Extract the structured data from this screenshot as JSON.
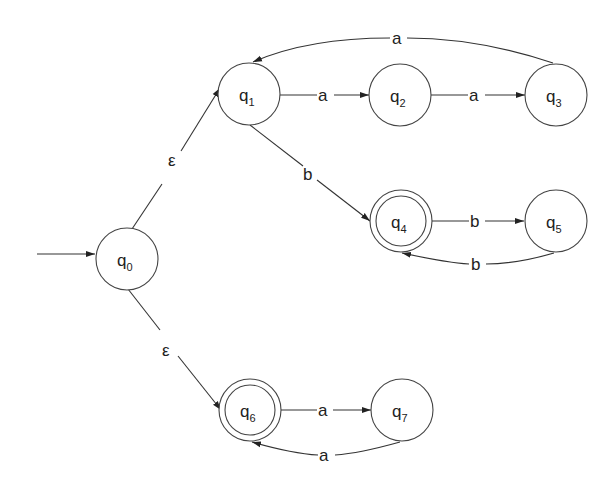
{
  "diagram": {
    "type": "NFA state diagram",
    "start_state": "q0",
    "nodes": [
      {
        "id": "q0",
        "base": "q",
        "sub": "0",
        "accepting": false,
        "cx": 127,
        "cy": 259
      },
      {
        "id": "q1",
        "base": "q",
        "sub": "1",
        "accepting": false,
        "cx": 249,
        "cy": 94
      },
      {
        "id": "q2",
        "base": "q",
        "sub": "2",
        "accepting": false,
        "cx": 400,
        "cy": 95
      },
      {
        "id": "q3",
        "base": "q",
        "sub": "3",
        "accepting": false,
        "cx": 556,
        "cy": 95
      },
      {
        "id": "q4",
        "base": "q",
        "sub": "4",
        "accepting": true,
        "cx": 401,
        "cy": 221
      },
      {
        "id": "q5",
        "base": "q",
        "sub": "5",
        "accepting": false,
        "cx": 556,
        "cy": 221
      },
      {
        "id": "q6",
        "base": "q",
        "sub": "6",
        "accepting": true,
        "cx": 250,
        "cy": 410
      },
      {
        "id": "q7",
        "base": "q",
        "sub": "7",
        "accepting": false,
        "cx": 402,
        "cy": 410
      }
    ],
    "edges": [
      {
        "from": "q0",
        "to": "q1",
        "label": "ε"
      },
      {
        "from": "q0",
        "to": "q6",
        "label": "ε"
      },
      {
        "from": "q1",
        "to": "q2",
        "label": "a"
      },
      {
        "from": "q2",
        "to": "q3",
        "label": "a"
      },
      {
        "from": "q3",
        "to": "q1",
        "label": "a"
      },
      {
        "from": "q1",
        "to": "q4",
        "label": "b"
      },
      {
        "from": "q4",
        "to": "q5",
        "label": "b"
      },
      {
        "from": "q5",
        "to": "q4",
        "label": "b"
      },
      {
        "from": "q6",
        "to": "q7",
        "label": "a"
      },
      {
        "from": "q7",
        "to": "q6",
        "label": "a"
      }
    ]
  },
  "labels": {
    "q0": {
      "base": "q",
      "sub": "0"
    },
    "q1": {
      "base": "q",
      "sub": "1"
    },
    "q2": {
      "base": "q",
      "sub": "2"
    },
    "q3": {
      "base": "q",
      "sub": "3"
    },
    "q4": {
      "base": "q",
      "sub": "4"
    },
    "q5": {
      "base": "q",
      "sub": "5"
    },
    "q6": {
      "base": "q",
      "sub": "6"
    },
    "q7": {
      "base": "q",
      "sub": "7"
    },
    "e_q0_q1": "ε",
    "e_q0_q6": "ε",
    "e_q1_q2": "a",
    "e_q2_q3": "a",
    "e_q3_q1": "a",
    "e_q1_q4": "b",
    "e_q4_q5": "b",
    "e_q5_q4": "b",
    "e_q6_q7": "a",
    "e_q7_q6": "a"
  }
}
